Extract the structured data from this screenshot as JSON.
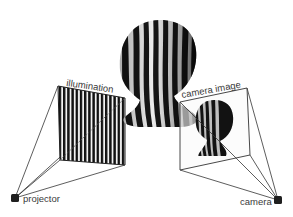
{
  "diagram": {
    "labels": {
      "illumination": "illumination",
      "camera_image": "camera image",
      "projector": "projector",
      "camera": "camera"
    },
    "nodes": [
      {
        "id": "projector",
        "label": "projector",
        "shape": "dark-square"
      },
      {
        "id": "illumination",
        "label": "illumination",
        "shape": "striped-panel"
      },
      {
        "id": "object",
        "label": "",
        "shape": "striped-head"
      },
      {
        "id": "camera_image",
        "label": "camera image",
        "shape": "image-panel"
      },
      {
        "id": "camera",
        "label": "camera",
        "shape": "dark-square"
      }
    ],
    "edges": [
      {
        "from": "projector",
        "to": "illumination",
        "type": "frustum"
      },
      {
        "from": "camera",
        "to": "camera_image",
        "type": "frustum"
      }
    ],
    "colors": {
      "background": "#ffffff",
      "line": "#333333",
      "stripe_dark": "#1a1a1a",
      "stripe_light": "#e6e6e6",
      "node": "#1f1f1f",
      "text": "#3a3a3a"
    }
  }
}
